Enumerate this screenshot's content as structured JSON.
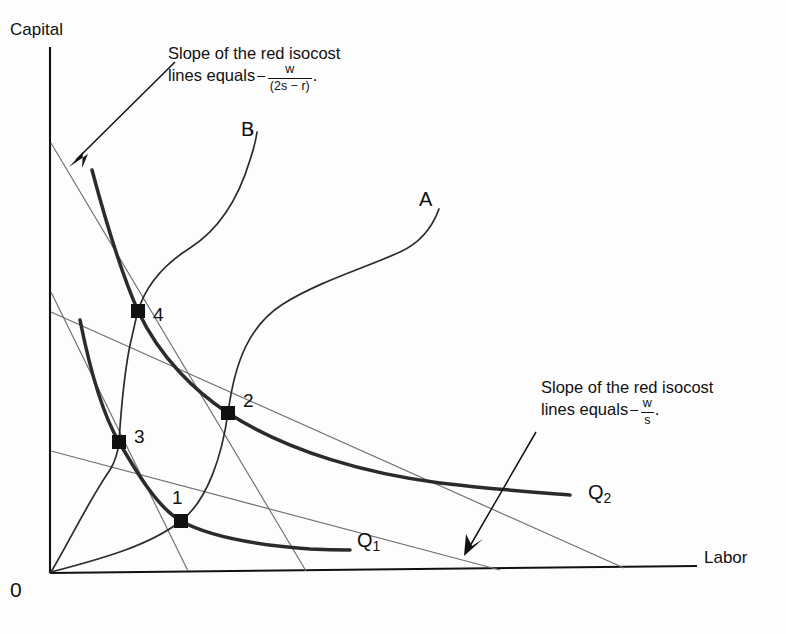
{
  "figure": {
    "axes": {
      "y_label": "Capital",
      "x_label": "Labor",
      "origin_label": "0"
    },
    "curve_labels": {
      "path_a": "A",
      "path_b": "B",
      "isoquant_q1": "Q",
      "isoquant_q1_sub": "1",
      "isoquant_q2": "Q",
      "isoquant_q2_sub": "2"
    },
    "points": [
      {
        "id": "1",
        "label": "1",
        "x": 181,
        "y": 521
      },
      {
        "id": "2",
        "label": "2",
        "x": 228,
        "y": 413
      },
      {
        "id": "3",
        "label": "3",
        "x": 119,
        "y": 442
      },
      {
        "id": "4",
        "label": "4",
        "x": 138,
        "y": 311
      }
    ],
    "annotations": [
      {
        "id": "annotation-steep-isocost",
        "line1": "Slope of the red isocost",
        "line2_prefix": "lines equals",
        "minus": "−",
        "numerator": "w",
        "denominator": "(2s − r)",
        "trailing": "."
      },
      {
        "id": "annotation-flat-isocost",
        "line1": "Slope of the red isocost",
        "line2_prefix": "lines equals",
        "minus": "−",
        "numerator": "w",
        "denominator": "s",
        "trailing": "."
      }
    ],
    "colors": {
      "ink": "#111111",
      "isoquant": "#2b2b2b",
      "isocost": "#6f6f6f",
      "axis": "#111111"
    }
  }
}
